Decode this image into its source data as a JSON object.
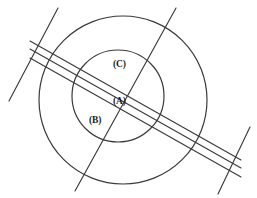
{
  "figure": {
    "type": "geometric-diagram",
    "background_color": "#ffffff",
    "stroke_color": "#3a3a3c",
    "label_color": "#1b1b1d",
    "canvas": {
      "width": 257,
      "height": 198
    },
    "labels": [
      {
        "id": "label-c",
        "text": "(C)",
        "x": 113,
        "y": 60
      },
      {
        "id": "label-a",
        "text": "(A)",
        "x": 113,
        "y": 97
      },
      {
        "id": "label-b",
        "text": "(B)",
        "x": 89,
        "y": 116
      }
    ],
    "circles": [
      {
        "id": "outer-circle",
        "cx": 123,
        "cy": 100,
        "r": 84
      },
      {
        "id": "inner-circle",
        "cx": 118,
        "cy": 96,
        "r": 46
      }
    ],
    "band_lines": [
      {
        "id": "band-line-upper",
        "x1": 30,
        "y1": 41,
        "x2": 241,
        "y2": 160
      },
      {
        "id": "band-line-middle",
        "x1": 30,
        "y1": 49,
        "x2": 241,
        "y2": 168
      },
      {
        "id": "band-line-lower",
        "x1": 30,
        "y1": 58,
        "x2": 241,
        "y2": 177
      }
    ],
    "transversal_lines": [
      {
        "id": "transversal-left",
        "x1": 58,
        "y1": 8,
        "x2": 9,
        "y2": 101
      },
      {
        "id": "transversal-right",
        "x1": 250,
        "y1": 127,
        "x2": 218,
        "y2": 194
      }
    ],
    "crossing_lines": [
      {
        "id": "crossing-diagonal",
        "x1": 176,
        "y1": 8,
        "x2": 75,
        "y2": 191
      }
    ]
  }
}
